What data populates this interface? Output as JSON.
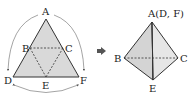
{
  "net": {
    "vertices": {
      "A": "A",
      "B": "B",
      "C": "C",
      "D": "D",
      "E": "E",
      "F": "F"
    },
    "fill": "#d9d9d9",
    "stroke": "#333333"
  },
  "arrow": {
    "icon": "right-arrow-icon",
    "color": "#555555"
  },
  "tetrahedron": {
    "apex_label": "A(D, F)",
    "vertices": {
      "B": "B",
      "C": "C",
      "E": "E"
    },
    "fill_left": "#d4d4d4",
    "fill_right": "#e6e6e6"
  }
}
